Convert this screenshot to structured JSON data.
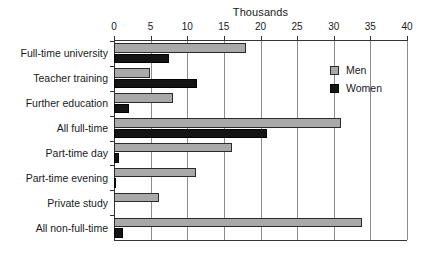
{
  "chart_data": {
    "type": "bar",
    "orientation": "horizontal",
    "title": "Thousands",
    "xlabel": "",
    "ylabel": "",
    "xlim": [
      0,
      40
    ],
    "xticks": [
      0,
      5,
      10,
      15,
      20,
      25,
      30,
      35,
      40
    ],
    "grid": true,
    "grid_axis": "x",
    "legend_position": "right",
    "categories": [
      "Full-time university",
      "Teacher training",
      "Further education",
      "All full-time",
      "Part-time day",
      "Part-time evening",
      "Private study",
      "All non-full-time"
    ],
    "series": [
      {
        "name": "Men",
        "color": "#a9a9a9",
        "values": [
          18.0,
          4.9,
          8.1,
          31.0,
          16.1,
          11.2,
          6.2,
          33.9
        ]
      },
      {
        "name": "Women",
        "color": "#141414",
        "values": [
          7.5,
          11.3,
          2.0,
          20.9,
          0.7,
          0.3,
          0.0,
          1.2
        ]
      }
    ]
  },
  "legend": {
    "entries": [
      {
        "label": "Men"
      },
      {
        "label": "Women"
      }
    ]
  },
  "colors": {
    "men": "#a9a9a9",
    "women": "#141414",
    "axis": "#333333",
    "grid": "#8c8c8c",
    "text": "#1a1a1a",
    "background": "#ffffff"
  }
}
